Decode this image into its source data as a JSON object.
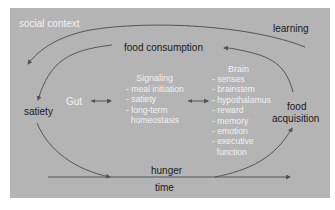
{
  "diagram": {
    "labels": {
      "social_context": "social context",
      "learning": "learning",
      "food_consumption": "food consumption",
      "satiety": "satiety",
      "gut": "Gut",
      "food_acquisition_line1": "food",
      "food_acquisition_line2": "acquisition",
      "hunger": "hunger",
      "time": "time"
    },
    "signaling": {
      "title": "Signaling",
      "items": [
        "- meal initiation",
        "- satiety",
        "- long-term",
        "  homeostasis"
      ]
    },
    "brain": {
      "title": "Brain",
      "items": [
        "- senses",
        "- brainstem",
        "- hypothalamus",
        "- reward",
        "- memory",
        "- emotion",
        "- executive",
        "  function"
      ]
    },
    "colors": {
      "panel_background": "#b4b4b4",
      "arrow": "#555555",
      "dark_text": "#1a1a1a",
      "light_text": "#f2f2f2"
    }
  }
}
